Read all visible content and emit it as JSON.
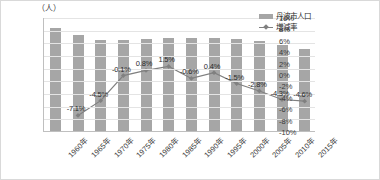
{
  "chart_data": {
    "type": "bar",
    "title": "",
    "unit_label": "（人）",
    "xlabel": "",
    "ylabel": "",
    "categories": [
      "1960年",
      "1965年",
      "1970年",
      "1975年",
      "1980年",
      "1985年",
      "1990年",
      "1995年",
      "2000年",
      "2005年",
      "2010年",
      "2015年"
    ],
    "series": [
      {
        "name": "丹波市人口",
        "type": "bar",
        "axis": "left",
        "color": "#a6a6a6",
        "values": [
          81000,
          75500,
          72000,
          71900,
          72500,
          73500,
          73100,
          73400,
          73000,
          71000,
          68000,
          65000
        ]
      },
      {
        "name": "増減率",
        "type": "line",
        "axis": "right",
        "color": "#808080",
        "values": [
          null,
          -7.1,
          -4.5,
          -0.1,
          0.8,
          1.5,
          -0.6,
          0.4,
          -1.5,
          -2.8,
          -4.3,
          -4.6
        ],
        "labels": [
          "",
          "-7.1%",
          "-4.5%",
          "-0.1%",
          "0.8%",
          "1.5%",
          "-0.6%",
          "0.4%",
          "-1.5%",
          "-2.8%",
          "-4.3%",
          "-4.6%"
        ]
      }
    ],
    "ylim": [
      0,
      90000
    ],
    "yticks": [
      0,
      10000,
      20000,
      30000,
      40000,
      50000,
      60000,
      70000,
      80000,
      90000
    ],
    "ytick_labels": [
      "0",
      "10,000",
      "20,000",
      "30,000",
      "40,000",
      "50,000",
      "60,000",
      "70,000",
      "80,000",
      "90,000"
    ],
    "y2lim": [
      -10,
      10
    ],
    "y2ticks": [
      -10,
      -8,
      -6,
      -4,
      -2,
      0,
      2,
      4,
      6,
      8,
      10
    ],
    "y2tick_labels": [
      "-10%",
      "-8%",
      "-6%",
      "-4%",
      "-2%",
      "0%",
      "2%",
      "4%",
      "6%",
      "8%",
      "10%"
    ],
    "grid": true,
    "legend_position": "top-right",
    "legend": [
      "丹波市人口",
      "増減率"
    ]
  }
}
